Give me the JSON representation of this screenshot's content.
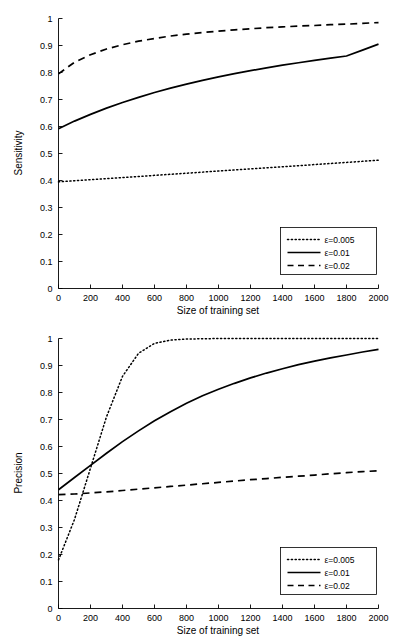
{
  "figure": {
    "name": "sensitivity-precision-vs-training-size",
    "background": "#ffffff",
    "line_color": "#000000"
  },
  "chart_data": [
    {
      "type": "line",
      "panel": "top",
      "title": "",
      "xlabel": "Size of training set",
      "ylabel": "Sensitivity",
      "xlim": [
        0,
        2000
      ],
      "ylim": [
        0,
        1
      ],
      "xticks": [
        0,
        200,
        400,
        600,
        800,
        1000,
        1200,
        1400,
        1600,
        1800,
        2000
      ],
      "yticks": [
        0,
        0.1,
        0.2,
        0.3,
        0.4,
        0.5,
        0.6,
        0.7,
        0.8,
        0.9,
        1
      ],
      "xticklabels": [
        "0",
        "200",
        "400",
        "600",
        "800",
        "1000",
        "1200",
        "1400",
        "1600",
        "1800",
        "2000"
      ],
      "yticklabels": [
        "0",
        "0.1",
        "0.2",
        "0.3",
        "0.4",
        "0.5",
        "0.6",
        "0.7",
        "0.8",
        "0.9",
        "1"
      ],
      "grid": false,
      "legend_position": "lower right",
      "x": [
        0,
        100,
        200,
        300,
        400,
        500,
        600,
        700,
        800,
        900,
        1000,
        1100,
        1200,
        1300,
        1400,
        1500,
        1600,
        1700,
        1800,
        1900,
        2000
      ],
      "series": [
        {
          "name": "ε=0.005",
          "style": "dotted",
          "values": [
            0.395,
            0.399,
            0.403,
            0.407,
            0.411,
            0.415,
            0.419,
            0.423,
            0.427,
            0.431,
            0.435,
            0.439,
            0.443,
            0.447,
            0.451,
            0.455,
            0.459,
            0.463,
            0.467,
            0.471,
            0.475
          ]
        },
        {
          "name": "ε=0.01",
          "style": "solid",
          "values": [
            0.592,
            0.62,
            0.645,
            0.668,
            0.689,
            0.708,
            0.726,
            0.742,
            0.757,
            0.771,
            0.784,
            0.796,
            0.807,
            0.817,
            0.827,
            0.836,
            0.845,
            0.853,
            0.861,
            0.883,
            0.905
          ]
        },
        {
          "name": "ε=0.02",
          "style": "dashed",
          "values": [
            0.795,
            0.838,
            0.866,
            0.887,
            0.903,
            0.916,
            0.926,
            0.935,
            0.942,
            0.948,
            0.953,
            0.958,
            0.962,
            0.966,
            0.969,
            0.972,
            0.974,
            0.977,
            0.979,
            0.982,
            0.985
          ]
        }
      ]
    },
    {
      "type": "line",
      "panel": "bottom",
      "title": "",
      "xlabel": "Size of training set",
      "ylabel": "Precision",
      "xlim": [
        0,
        2000
      ],
      "ylim": [
        0,
        1
      ],
      "xticks": [
        0,
        200,
        400,
        600,
        800,
        1000,
        1200,
        1400,
        1600,
        1800,
        2000
      ],
      "yticks": [
        0,
        0.1,
        0.2,
        0.3,
        0.4,
        0.5,
        0.6,
        0.7,
        0.8,
        0.9,
        1
      ],
      "xticklabels": [
        "0",
        "200",
        "400",
        "600",
        "800",
        "1000",
        "1200",
        "1400",
        "1600",
        "1800",
        "2000"
      ],
      "yticklabels": [
        "0",
        "0.1",
        "0.2",
        "0.3",
        "0.4",
        "0.5",
        "0.6",
        "0.7",
        "0.8",
        "0.9",
        "1"
      ],
      "grid": false,
      "legend_position": "lower right",
      "x": [
        0,
        100,
        200,
        300,
        400,
        500,
        600,
        700,
        800,
        900,
        1000,
        1100,
        1200,
        1300,
        1400,
        1500,
        1600,
        1700,
        1800,
        1900,
        2000
      ],
      "series": [
        {
          "name": "ε=0.005",
          "style": "dotted",
          "values": [
            0.18,
            0.33,
            0.52,
            0.71,
            0.86,
            0.945,
            0.982,
            0.994,
            0.998,
            0.999,
            1.0,
            1.0,
            1.0,
            1.0,
            1.0,
            1.0,
            1.0,
            1.0,
            1.0,
            1.0,
            1.0
          ]
        },
        {
          "name": "ε=0.01",
          "style": "solid",
          "values": [
            0.44,
            0.485,
            0.53,
            0.575,
            0.618,
            0.658,
            0.695,
            0.729,
            0.76,
            0.788,
            0.812,
            0.834,
            0.854,
            0.872,
            0.888,
            0.903,
            0.916,
            0.928,
            0.939,
            0.95,
            0.96
          ]
        },
        {
          "name": "ε=0.02",
          "style": "dashed",
          "values": [
            0.422,
            0.424,
            0.428,
            0.432,
            0.437,
            0.442,
            0.447,
            0.452,
            0.457,
            0.462,
            0.467,
            0.472,
            0.477,
            0.481,
            0.486,
            0.49,
            0.494,
            0.499,
            0.503,
            0.507,
            0.51
          ]
        }
      ]
    }
  ]
}
